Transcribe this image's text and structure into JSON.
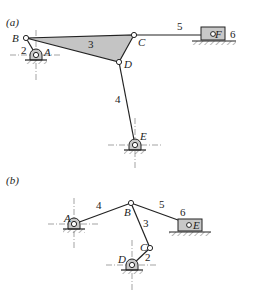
{
  "figure": {
    "panel_a": {
      "label": "(a)",
      "joints": {
        "A": "A",
        "B": "B",
        "C": "C",
        "D": "D",
        "E": "E",
        "F": "F"
      },
      "links": {
        "l2": "2",
        "l3": "3",
        "l4": "4",
        "l5": "5",
        "l6": "6"
      }
    },
    "panel_b": {
      "label": "(b)",
      "joints": {
        "A": "A",
        "B": "B",
        "C": "C",
        "D": "D",
        "E": "E"
      },
      "links": {
        "l2": "2",
        "l3": "3",
        "l4": "4",
        "l5": "5",
        "l6": "6"
      }
    },
    "colors": {
      "shade": "#c4c4c4",
      "line": "#222222",
      "background": "#ffffff"
    }
  }
}
